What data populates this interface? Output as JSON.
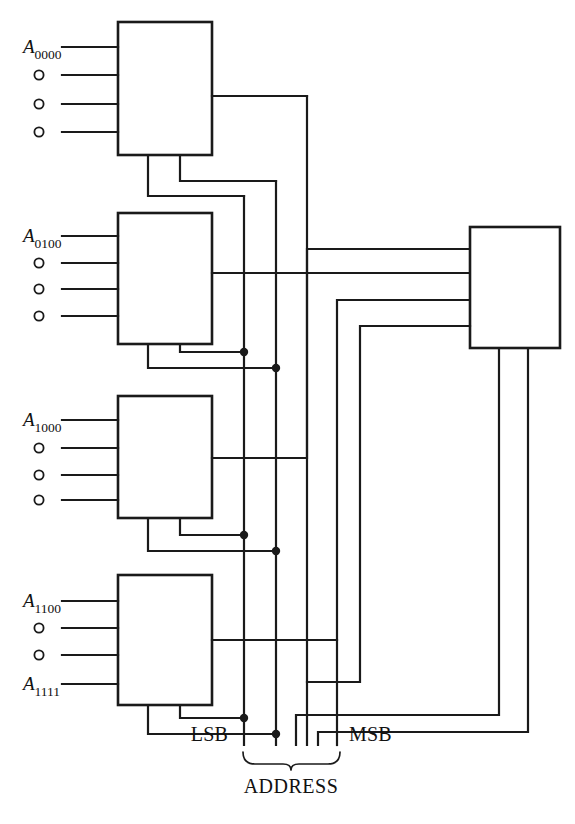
{
  "figure": {
    "kind": "logic-block-diagram",
    "width": 575,
    "height": 824,
    "ink_color": "#1a1a1a",
    "background_color": "#ffffff"
  },
  "memory_blocks": [
    {
      "id": "block-1",
      "index": 1,
      "first_address_base": "A",
      "first_address_sub": "0000",
      "last_address_base": "",
      "last_address_sub": "",
      "input_count": 4,
      "open_circle_count": 3,
      "x": 118,
      "y": 22,
      "w": 94,
      "h": 133,
      "input_ys": [
        47,
        75,
        104,
        132
      ],
      "output_y": 96
    },
    {
      "id": "block-2",
      "index": 2,
      "first_address_base": "A",
      "first_address_sub": "0100",
      "last_address_base": "",
      "last_address_sub": "",
      "input_count": 4,
      "open_circle_count": 3,
      "x": 118,
      "y": 213,
      "w": 94,
      "h": 131,
      "input_ys": [
        236,
        263,
        289,
        316
      ],
      "output_y": 273
    },
    {
      "id": "block-3",
      "index": 3,
      "first_address_base": "A",
      "first_address_sub": "1000",
      "last_address_base": "",
      "last_address_sub": "",
      "input_count": 4,
      "open_circle_count": 3,
      "x": 118,
      "y": 396,
      "w": 94,
      "h": 122,
      "input_ys": [
        420,
        448,
        475,
        500
      ],
      "output_y": 458
    },
    {
      "id": "block-4",
      "index": 4,
      "first_address_base": "A",
      "first_address_sub": "1100",
      "last_address_base": "A",
      "last_address_sub": "1111",
      "input_count": 4,
      "open_circle_count": 2,
      "x": 118,
      "y": 575,
      "w": 94,
      "h": 130,
      "input_ys": [
        601,
        628,
        655,
        684
      ],
      "output_y": 640
    }
  ],
  "decoder_block": {
    "id": "decoder",
    "x": 470,
    "y": 227,
    "w": 90,
    "h": 121,
    "input_ys": [
      249,
      273,
      300,
      326
    ],
    "bottom_xs": [
      499,
      528
    ]
  },
  "address_bus": {
    "line_xs": [
      244,
      276,
      307,
      337
    ],
    "bottom_y": 745,
    "lsb_label": "LSB",
    "msb_label": "MSB",
    "bus_label": "ADDRESS",
    "brace": {
      "x_left": 243,
      "x_right": 340,
      "y_top": 752,
      "tip_x": 291,
      "y_tip": 768
    },
    "lsb_label_x": 228,
    "msb_label_x": 349,
    "label_y": 741,
    "bus_label_x": 291,
    "bus_label_y": 792
  },
  "junction_dots": [
    {
      "x": 244,
      "y": 352
    },
    {
      "x": 276,
      "y": 368
    },
    {
      "x": 244,
      "y": 535
    },
    {
      "x": 276,
      "y": 551
    },
    {
      "x": 244,
      "y": 718
    },
    {
      "x": 276,
      "y": 734
    }
  ]
}
